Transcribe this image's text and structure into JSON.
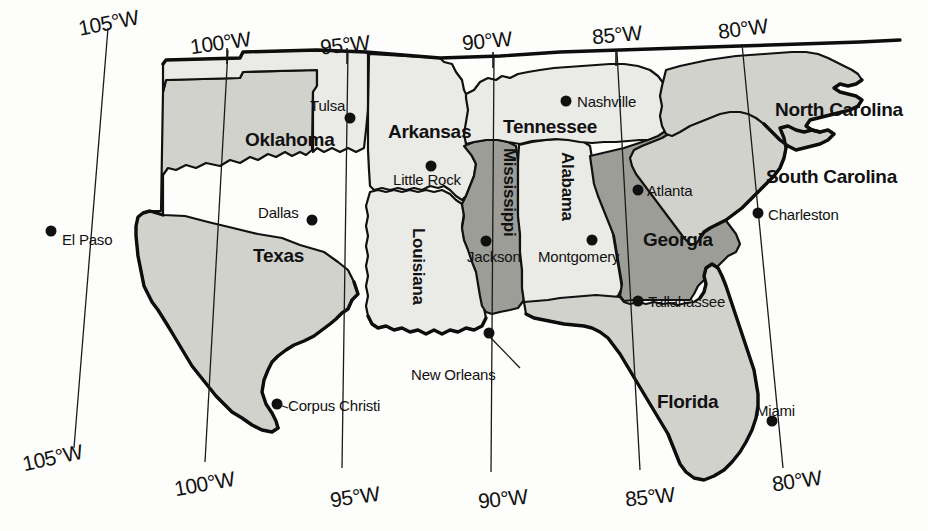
{
  "map": {
    "title": "Southeastern United States reference map",
    "projection_note": "Longitude graticule labeled top and bottom",
    "colors": {
      "background": "#fdfdfb",
      "fill_light": "#eaeae6",
      "fill_medium": "#d2d2cd",
      "fill_dark": "#9d9d98",
      "outline": "#111111",
      "city_dot": "#101010"
    },
    "graticule": {
      "top_labels": [
        "105°W",
        "100°W",
        "95°W",
        "90°W",
        "85°W",
        "80°W"
      ],
      "bottom_labels": [
        "105°W",
        "100°W",
        "95°W",
        "90°W",
        "85°W",
        "80°W"
      ]
    },
    "states": [
      {
        "name": "Texas",
        "shade": "medium"
      },
      {
        "name": "Oklahoma",
        "shade": "light"
      },
      {
        "name": "Arkansas",
        "shade": "light"
      },
      {
        "name": "Louisiana",
        "shade": "light"
      },
      {
        "name": "Mississippi",
        "shade": "dark"
      },
      {
        "name": "Alabama",
        "shade": "light"
      },
      {
        "name": "Tennessee",
        "shade": "light"
      },
      {
        "name": "Georgia",
        "shade": "dark"
      },
      {
        "name": "Florida",
        "shade": "medium"
      },
      {
        "name": "South Carolina",
        "shade": "medium"
      },
      {
        "name": "North Carolina",
        "shade": "medium"
      }
    ],
    "cities": [
      {
        "name": "El Paso",
        "state": "Texas"
      },
      {
        "name": "Dallas",
        "state": "Texas"
      },
      {
        "name": "Corpus Christi",
        "state": "Texas"
      },
      {
        "name": "Tulsa",
        "state": "Oklahoma"
      },
      {
        "name": "Little Rock",
        "state": "Arkansas"
      },
      {
        "name": "New Orleans",
        "state": "Louisiana"
      },
      {
        "name": "Jackson",
        "state": "Mississippi"
      },
      {
        "name": "Montgomery",
        "state": "Alabama"
      },
      {
        "name": "Nashville",
        "state": "Tennessee"
      },
      {
        "name": "Atlanta",
        "state": "Georgia"
      },
      {
        "name": "Tallahassee",
        "state": "Florida"
      },
      {
        "name": "Miami",
        "state": "Florida"
      },
      {
        "name": "Charleston",
        "state": "South Carolina"
      }
    ]
  }
}
